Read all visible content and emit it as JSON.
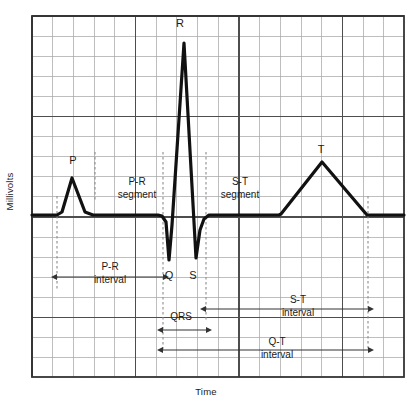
{
  "figure": {
    "axes": {
      "y_label": "Millivolts",
      "x_label": "Time"
    },
    "colors": {
      "trace": "#111111",
      "grid_major": "#4d4d4d",
      "grid_minor": "#9a9a9a",
      "border": "#333333",
      "guide_dashed": "#8c8c8c",
      "text": "#1a1a1a",
      "background": "#ffffff"
    },
    "grid": {
      "left": 32,
      "right": 404,
      "top": 16,
      "bottom": 377,
      "minor_step_x": 20.7,
      "minor_step_y": 20.1,
      "major_every": 5
    }
  },
  "wave_labels": [
    {
      "id": "p-wave-label",
      "text": "P",
      "x": 73,
      "y": 155
    },
    {
      "id": "r-wave-label",
      "text": "R",
      "x": 180,
      "y": 18
    },
    {
      "id": "q-wave-label",
      "text": "Q",
      "x": 169,
      "y": 270
    },
    {
      "id": "s-wave-label",
      "text": "S",
      "x": 193,
      "y": 270
    },
    {
      "id": "t-wave-label",
      "text": "T",
      "x": 321,
      "y": 144
    }
  ],
  "segment_labels": [
    {
      "id": "pr-segment-label",
      "line1": "P-R",
      "line2": "segment",
      "x": 137,
      "y": 185
    },
    {
      "id": "st-segment-label",
      "line1": "S-T",
      "line2": "segment",
      "x": 240,
      "y": 185
    }
  ],
  "interval_labels": [
    {
      "id": "pr-interval-label",
      "line1": "P-R",
      "line2": "interval",
      "x": 110,
      "y": 270
    },
    {
      "id": "qrs-interval-label",
      "line1": "QRS",
      "line2": "",
      "x": 181,
      "y": 320
    },
    {
      "id": "st-interval-label",
      "line1": "S-T",
      "line2": "interval",
      "x": 298,
      "y": 303
    },
    {
      "id": "qt-interval-label",
      "line1": "Q-T",
      "line2": "interval",
      "x": 277,
      "y": 345
    }
  ],
  "chart_data": {
    "type": "line",
    "xlabel": "Time",
    "ylabel": "Millivolts",
    "grid": true,
    "legend": null,
    "baseline_y_px": 215,
    "series": [
      {
        "name": "ECG trace",
        "points_px": [
          [
            32,
            215
          ],
          [
            57,
            215
          ],
          [
            62,
            212
          ],
          [
            72,
            178
          ],
          [
            85,
            212
          ],
          [
            93,
            215
          ],
          [
            158,
            215
          ],
          [
            162,
            216
          ],
          [
            166,
            222
          ],
          [
            169,
            260
          ],
          [
            172,
            225
          ],
          [
            184,
            43
          ],
          [
            196,
            258
          ],
          [
            200,
            230
          ],
          [
            204,
            219
          ],
          [
            209,
            215
          ],
          [
            279,
            215
          ],
          [
            281,
            214
          ],
          [
            322,
            162
          ],
          [
            367,
            215
          ],
          [
            404,
            215
          ]
        ]
      }
    ],
    "features": [
      {
        "name": "P wave peak",
        "x_px": 72,
        "y_px": 178
      },
      {
        "name": "Q wave trough",
        "x_px": 169,
        "y_px": 260
      },
      {
        "name": "R wave peak",
        "x_px": 184,
        "y_px": 43
      },
      {
        "name": "S wave trough",
        "x_px": 196,
        "y_px": 258
      },
      {
        "name": "T wave peak",
        "x_px": 322,
        "y_px": 162
      }
    ],
    "guides_px": [
      {
        "name": "p-onset-guide",
        "x": 57,
        "y1": 196,
        "y2": 291
      },
      {
        "name": "pr-segment-start-guide",
        "x": 95,
        "y1": 152,
        "y2": 200
      },
      {
        "name": "q-onset-guide",
        "x": 163,
        "y1": 152,
        "y2": 350
      },
      {
        "name": "s-offset-guide",
        "x": 206,
        "y1": 152,
        "y2": 320
      },
      {
        "name": "t-offset-guide",
        "x": 368,
        "y1": 196,
        "y2": 350
      }
    ],
    "measurements_px": [
      {
        "name": "P-R interval",
        "x1": 57,
        "x2": 163,
        "y": 277,
        "arrows": "both"
      },
      {
        "name": "QRS duration",
        "x1": 163,
        "x2": 206,
        "y": 330,
        "arrows": "both"
      },
      {
        "name": "S-T interval",
        "x1": 206,
        "x2": 368,
        "y": 309,
        "arrows": "both"
      },
      {
        "name": "Q-T interval",
        "x1": 163,
        "x2": 368,
        "y": 350,
        "arrows": "both"
      }
    ]
  }
}
